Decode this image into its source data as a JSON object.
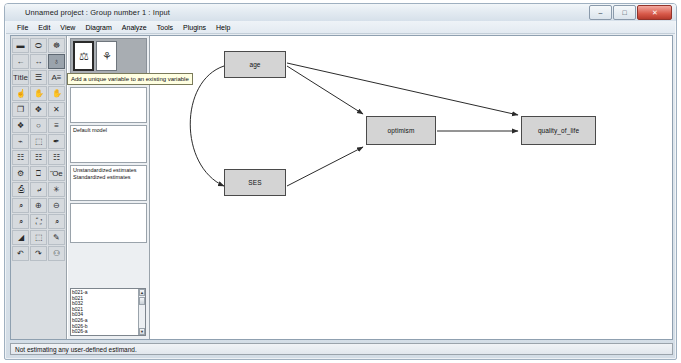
{
  "window": {
    "title": "Unnamed project : Group number 1 : Input",
    "app_icon": "amos-icon",
    "controls": {
      "minimize": "–",
      "maximize": "□",
      "close": "✕"
    }
  },
  "menubar": {
    "items": [
      {
        "label": "File"
      },
      {
        "label": "Edit"
      },
      {
        "label": "View"
      },
      {
        "label": "Diagram"
      },
      {
        "label": "Analyze"
      },
      {
        "label": "Tools"
      },
      {
        "label": "Plugins"
      },
      {
        "label": "Help"
      }
    ]
  },
  "palette": {
    "tools": [
      {
        "name": "draw-observed-variable",
        "glyph": "▬",
        "selected": false
      },
      {
        "name": "draw-unobserved-variable",
        "glyph": "⬭",
        "selected": false
      },
      {
        "name": "draw-latent-with-indicators",
        "glyph": "☸",
        "selected": false
      },
      {
        "name": "draw-path-single-headed",
        "glyph": "←",
        "selected": false
      },
      {
        "name": "draw-covariance-double-headed",
        "glyph": "↔",
        "selected": false
      },
      {
        "name": "add-unique-variable",
        "glyph": "♁",
        "selected": true
      },
      {
        "name": "figure-caption",
        "glyph": "Title",
        "selected": false
      },
      {
        "name": "list-variables-in-model",
        "glyph": "☰",
        "selected": false
      },
      {
        "name": "list-variables-in-dataset",
        "glyph": "A≡",
        "selected": false
      },
      {
        "name": "select-one-object",
        "glyph": "☝",
        "selected": false
      },
      {
        "name": "select-all-objects",
        "glyph": "✋",
        "selected": false
      },
      {
        "name": "deselect-all-objects",
        "glyph": "✋",
        "selected": false
      },
      {
        "name": "duplicate-objects",
        "glyph": "❐",
        "selected": false
      },
      {
        "name": "move-objects",
        "glyph": "✥",
        "selected": false
      },
      {
        "name": "erase-objects",
        "glyph": "✕",
        "selected": false
      },
      {
        "name": "change-shape-of-objects",
        "glyph": "❖",
        "selected": false
      },
      {
        "name": "rotate-indicators",
        "glyph": "○",
        "selected": false
      },
      {
        "name": "reflect-indicators",
        "glyph": "≡",
        "selected": false
      },
      {
        "name": "move-parameter-values",
        "glyph": "⌁",
        "selected": false
      },
      {
        "name": "touch-up-variable",
        "glyph": "⬚",
        "selected": false
      },
      {
        "name": "select-data-file",
        "glyph": "✒",
        "selected": false
      },
      {
        "name": "analysis-properties",
        "glyph": "☷",
        "selected": false
      },
      {
        "name": "object-properties",
        "glyph": "☷",
        "selected": false
      },
      {
        "name": "text-output",
        "glyph": "☷",
        "selected": false
      },
      {
        "name": "calculate-estimates",
        "glyph": "⚙",
        "selected": false
      },
      {
        "name": "copy-to-clipboard",
        "glyph": "⎕",
        "selected": false
      },
      {
        "name": "save-current-diagram",
        "glyph": "Ὃe",
        "selected": false
      },
      {
        "name": "print-diagram",
        "glyph": "⎙",
        "selected": false
      },
      {
        "name": "drag-properties",
        "glyph": "⤶",
        "selected": false
      },
      {
        "name": "preserve-symmetries",
        "glyph": "✳",
        "selected": false
      },
      {
        "name": "zoom-in-region",
        "glyph": "⌕",
        "selected": false
      },
      {
        "name": "zoom-in",
        "glyph": "⊕",
        "selected": false
      },
      {
        "name": "zoom-out",
        "glyph": "⊖",
        "selected": false
      },
      {
        "name": "zoom-page",
        "glyph": "⌕",
        "selected": false
      },
      {
        "name": "fit-to-page",
        "glyph": "⛶",
        "selected": false
      },
      {
        "name": "loupe-magnify",
        "glyph": "⌕",
        "selected": false
      },
      {
        "name": "bayesian-estimation",
        "glyph": "◢",
        "selected": false
      },
      {
        "name": "multiple-group-analysis",
        "glyph": "⬚",
        "selected": false
      },
      {
        "name": "print-preview",
        "glyph": "✎",
        "selected": false
      },
      {
        "name": "undo",
        "glyph": "↶",
        "selected": false
      },
      {
        "name": "redo",
        "glyph": "↷",
        "selected": false
      },
      {
        "name": "browse-path-diagrams",
        "glyph": "⚇",
        "selected": false
      }
    ]
  },
  "midpanel": {
    "thumbnails": [
      {
        "name": "model-thumbnail-input",
        "selected": true
      },
      {
        "name": "model-thumbnail-output",
        "selected": false
      }
    ],
    "group_label": "Group number 1",
    "model_label": "Default model",
    "estimates": [
      "Unstandardized estimates",
      "Standardized estimates"
    ],
    "estimand_list": [
      "b021-a",
      "b021",
      "b032",
      "b021",
      "b034",
      "b026-a",
      "b026-b",
      "b026-a",
      "b026-ab"
    ]
  },
  "tooltip": {
    "text": "Add a unique variable to an existing variable"
  },
  "diagram": {
    "nodes": [
      {
        "name": "node-age",
        "label": "age",
        "x": 73,
        "y": 15,
        "w": 62,
        "h": 27
      },
      {
        "name": "node-ses",
        "label": "SES",
        "x": 73,
        "y": 133,
        "w": 62,
        "h": 27
      },
      {
        "name": "node-optimism",
        "label": "optimism",
        "x": 215,
        "y": 80,
        "w": 70,
        "h": 29
      },
      {
        "name": "node-quality-of-life",
        "label": "quality_of_life",
        "x": 370,
        "y": 80,
        "w": 75,
        "h": 29
      }
    ],
    "edges": [
      {
        "name": "edge-age-to-optimism",
        "from": "age",
        "to": "optimism",
        "type": "directed"
      },
      {
        "name": "edge-age-to-quality-of-life",
        "from": "age",
        "to": "quality_of_life",
        "type": "directed"
      },
      {
        "name": "edge-ses-to-optimism",
        "from": "SES",
        "to": "optimism",
        "type": "directed"
      },
      {
        "name": "edge-optimism-to-quality",
        "from": "optimism",
        "to": "quality_of_life",
        "type": "directed"
      },
      {
        "name": "edge-age-ses-covariance",
        "from": "age",
        "to": "SES",
        "type": "double-headed-curve"
      }
    ]
  },
  "statusbar": {
    "text": "Not estimating any user-defined estimand."
  },
  "colors": {
    "node_fill": "#d4d4d4",
    "node_stroke": "#4a4a4a",
    "panel_bg": "#eceff2",
    "palette_bg": "#d9dde1",
    "tooltip_bg": "#ffffe1"
  }
}
